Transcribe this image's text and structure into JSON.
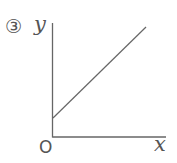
{
  "problem": {
    "number_label": "③"
  },
  "axes": {
    "x_label": "x",
    "y_label": "y",
    "origin_label": "O"
  },
  "line": {
    "description": "straight line with positive slope and positive y-intercept",
    "slope_sign": "positive",
    "y_intercept_sign": "positive"
  },
  "colors": {
    "axis": "#666666",
    "line": "#666666",
    "text": "#555555"
  }
}
